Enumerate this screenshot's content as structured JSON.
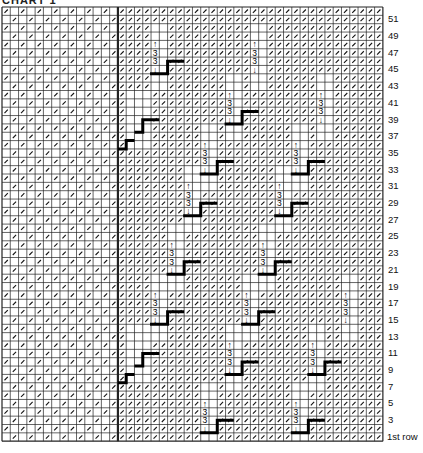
{
  "title": "CHART 1",
  "grid": {
    "left": 2,
    "top": 7,
    "cols": 46,
    "rows": 52,
    "cell_w": 8.28,
    "cell_h": 8.35,
    "divider_col": 14,
    "line_color": "#222222",
    "slash_color": "#111111",
    "step_color": "#000000"
  },
  "row_labels": [
    {
      "row": 51,
      "text": "51"
    },
    {
      "row": 49,
      "text": "49"
    },
    {
      "row": 47,
      "text": "47"
    },
    {
      "row": 45,
      "text": "45"
    },
    {
      "row": 43,
      "text": "43"
    },
    {
      "row": 41,
      "text": "41"
    },
    {
      "row": 39,
      "text": "39"
    },
    {
      "row": 37,
      "text": "37"
    },
    {
      "row": 35,
      "text": "35"
    },
    {
      "row": 33,
      "text": "33"
    },
    {
      "row": 31,
      "text": "31"
    },
    {
      "row": 29,
      "text": "29"
    },
    {
      "row": 27,
      "text": "27"
    },
    {
      "row": 25,
      "text": "25"
    },
    {
      "row": 23,
      "text": "23"
    },
    {
      "row": 21,
      "text": "21"
    },
    {
      "row": 19,
      "text": "19"
    },
    {
      "row": 17,
      "text": "17"
    },
    {
      "row": 15,
      "text": "15"
    },
    {
      "row": 13,
      "text": "13"
    },
    {
      "row": 11,
      "text": "11"
    },
    {
      "row": 9,
      "text": "9"
    },
    {
      "row": 7,
      "text": "7"
    },
    {
      "row": 5,
      "text": "5"
    },
    {
      "row": 3,
      "text": "3"
    },
    {
      "row": 1,
      "text": "1st row"
    }
  ],
  "cable_symbol": {
    "up": "↑",
    "num": "3",
    "down": "↓"
  },
  "cables": [
    {
      "col": 18,
      "top": 4,
      "step": true
    },
    {
      "col": 30,
      "top": 4,
      "step": false
    },
    {
      "col": 27,
      "top": 10,
      "step": true
    },
    {
      "col": 38,
      "top": 10,
      "step": false
    },
    {
      "col": 24,
      "top": 16,
      "step": true
    },
    {
      "col": 35,
      "top": 16,
      "step": true
    },
    {
      "col": 22,
      "top": 21,
      "step": true
    },
    {
      "col": 33,
      "top": 21,
      "step": true
    },
    {
      "col": 20,
      "top": 28,
      "step": true
    },
    {
      "col": 31,
      "top": 28,
      "step": true
    },
    {
      "col": 18,
      "top": 34,
      "step": true
    },
    {
      "col": 29,
      "top": 34,
      "step": true
    },
    {
      "col": 41,
      "top": 34,
      "step": false
    },
    {
      "col": 27,
      "top": 40,
      "step": true
    },
    {
      "col": 37,
      "top": 40,
      "step": true
    },
    {
      "col": 24,
      "top": 47,
      "step": true
    },
    {
      "col": 35,
      "top": 47,
      "step": true
    }
  ],
  "staircases": [
    {
      "col": 15,
      "bottom_row": 16
    },
    {
      "col": 15,
      "bottom_row": 44
    }
  ]
}
